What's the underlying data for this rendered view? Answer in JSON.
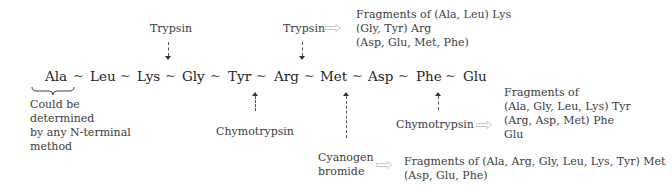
{
  "diagram": {
    "sequence": [
      "Ala",
      "Leu",
      "Lys",
      "Gly",
      "Tyr",
      "Arg",
      "Met",
      "Asp",
      "Phe",
      "Glu"
    ],
    "bond_symbol": "~",
    "n_terminal_note": [
      "Could be",
      "determined",
      "by any N-terminal",
      "method"
    ],
    "cleavages": [
      {
        "agent": "Trypsin",
        "site": "Lys~Gly",
        "direction": "above"
      },
      {
        "agent": "Trypsin",
        "site": "Arg~Met",
        "direction": "above",
        "fragments": [
          "Fragments of (Ala, Leu) Lys",
          "(Gly, Tyr) Arg",
          "(Asp, Glu, Met, Phe)"
        ]
      },
      {
        "agent": "Chymotrypsin",
        "site": "Tyr~Arg",
        "direction": "below"
      },
      {
        "agent": "Cyanogen bromide",
        "agent_lines": [
          "Cyanogen",
          "bromide"
        ],
        "site": "Met~Asp",
        "direction": "below",
        "fragments": [
          "Fragments of (Ala, Arg, Gly, Leu, Lys, Tyr) Met",
          "(Asp, Glu, Phe)"
        ]
      },
      {
        "agent": "Chymotrypsin",
        "site": "Phe~Glu",
        "direction": "below",
        "fragments": [
          "Fragments of",
          "(Ala,  Gly, Leu, Lys) Tyr",
          "(Arg, Asp, Met) Phe",
          "Glu"
        ]
      }
    ]
  }
}
